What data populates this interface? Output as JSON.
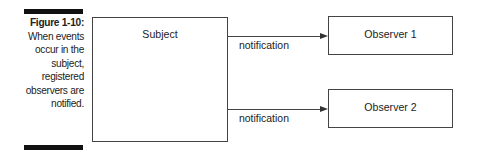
{
  "caption": {
    "figure_label": "Figure 1-10:",
    "text": "When events occur in the subject, registered observers are notified."
  },
  "diagram": {
    "subject": {
      "label": "Subject"
    },
    "observers": [
      {
        "label": "Observer 1",
        "arrow_label": "notification"
      },
      {
        "label": "Observer 2",
        "arrow_label": "notification"
      }
    ]
  }
}
